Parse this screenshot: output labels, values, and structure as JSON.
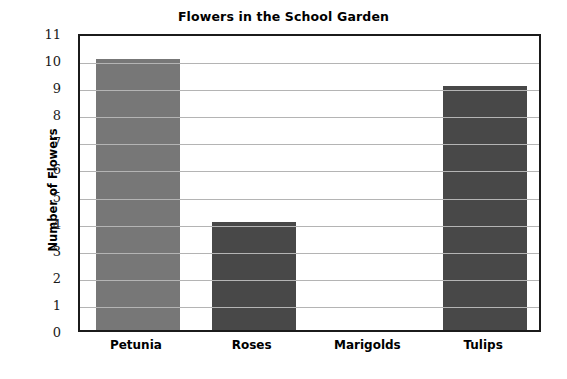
{
  "chart_data": {
    "type": "bar",
    "title": "Flowers in the School Garden",
    "xlabel": "",
    "ylabel": "Number of Flowers",
    "categories": [
      "Petunia",
      "Roses",
      "Marigolds",
      "Tulips"
    ],
    "values": [
      10,
      4,
      0,
      9
    ],
    "ylim": [
      0,
      11
    ],
    "ytick_step": 1,
    "yticks": [
      11,
      10,
      9,
      8,
      7,
      6,
      5,
      4,
      3,
      2,
      1,
      0
    ],
    "grid": true,
    "grid_axis": "y",
    "legend": null,
    "bar_colors": [
      "#777777",
      "#484848",
      "#484848",
      "#484848"
    ],
    "grid_color": "#b4b4b4",
    "frame_color": "#1b1b1b",
    "background": "#ffffff"
  }
}
